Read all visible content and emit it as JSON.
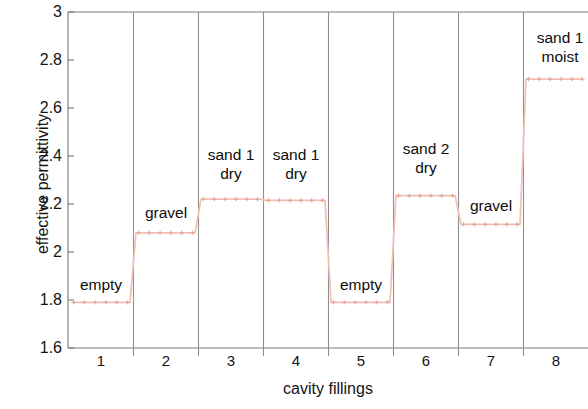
{
  "chart_data": {
    "type": "line",
    "title": "",
    "xlabel": "cavity fillings",
    "ylabel": "effective permittivity",
    "xlim": [
      0.5,
      8.5
    ],
    "ylim": [
      1.6,
      3.0
    ],
    "yticks": [
      "1.6",
      "1.8",
      "2",
      "2.2",
      "2.4",
      "2.6",
      "2.8",
      "3"
    ],
    "ytick_values": [
      1.6,
      1.8,
      2.0,
      2.2,
      2.4,
      2.6,
      2.8,
      3.0
    ],
    "xticks": [
      "1",
      "2",
      "3",
      "4",
      "5",
      "6",
      "7",
      "8"
    ],
    "xtick_values": [
      1,
      2,
      3,
      4,
      5,
      6,
      7,
      8
    ],
    "grid": "vertical-segment-dividers",
    "legend": "none",
    "line_color": "#f2c5bc",
    "marker_color": "#e8a497",
    "axis_color": "#6e6e6e",
    "series": [
      {
        "name": "effective permittivity",
        "categories": [
          1,
          2,
          3,
          4,
          5,
          6,
          7,
          8
        ],
        "values": [
          1.79,
          2.08,
          2.22,
          2.215,
          1.79,
          2.235,
          2.115,
          2.72
        ]
      }
    ],
    "annotations": [
      {
        "segment": 1,
        "text": "empty",
        "line2": ""
      },
      {
        "segment": 2,
        "text": "gravel",
        "line2": ""
      },
      {
        "segment": 3,
        "text": "sand 1",
        "line2": "dry"
      },
      {
        "segment": 4,
        "text": "sand 1",
        "line2": "dry"
      },
      {
        "segment": 5,
        "text": "empty",
        "line2": ""
      },
      {
        "segment": 6,
        "text": "sand 2",
        "line2": "dry"
      },
      {
        "segment": 7,
        "text": "gravel",
        "line2": ""
      },
      {
        "segment": 8,
        "text": "sand 1",
        "line2": "moist"
      }
    ]
  },
  "axis": {
    "y_title": "effective permittivity",
    "x_title": "cavity fillings",
    "y_labels": [
      "3",
      "2.8",
      "2.6",
      "2.4",
      "2.2",
      "2",
      "1.8",
      "1.6"
    ],
    "x_labels": [
      "1",
      "2",
      "3",
      "4",
      "5",
      "6",
      "7",
      "8"
    ]
  },
  "annotations": {
    "a1_l1": "empty",
    "a1_l2": "",
    "a2_l1": "gravel",
    "a2_l2": "",
    "a3_l1": "sand 1",
    "a3_l2": "dry",
    "a4_l1": "sand 1",
    "a4_l2": "dry",
    "a5_l1": "empty",
    "a5_l2": "",
    "a6_l1": "sand 2",
    "a6_l2": "dry",
    "a7_l1": "gravel",
    "a7_l2": "",
    "a8_l1": "sand 1",
    "a8_l2": "moist"
  }
}
